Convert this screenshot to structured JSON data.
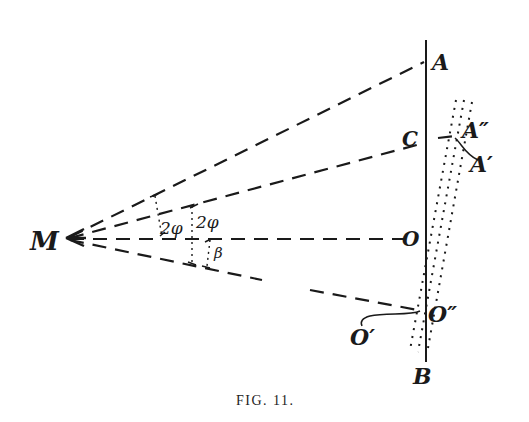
{
  "figure": {
    "caption": "FIG. 11.",
    "labels": {
      "M": "M",
      "A": "A",
      "C": "C",
      "O": "O",
      "O_double_prime": "O″",
      "O_prime": "O′",
      "A_double_prime": "A″",
      "A_prime": "A′",
      "B": "B"
    },
    "angle_labels": {
      "first": "2φ",
      "second": "2φ",
      "beta": "β"
    },
    "colors": {
      "ink": "#1a1a1a",
      "background": "#ffffff"
    }
  }
}
